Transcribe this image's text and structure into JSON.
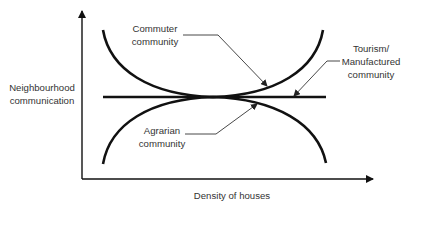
{
  "diagram": {
    "y_axis_label": [
      "Neighbourhood",
      "communication"
    ],
    "x_axis_label": "Density of houses",
    "labels": {
      "commuter": [
        "Commuter",
        "community"
      ],
      "tourism": [
        "Tourism/",
        "Manufactured",
        "community"
      ],
      "agrarian": [
        "Agrarian",
        "community"
      ]
    },
    "colors": {
      "line": "#111111",
      "leader": "#333333",
      "text": "#333333",
      "background": "#ffffff"
    }
  }
}
